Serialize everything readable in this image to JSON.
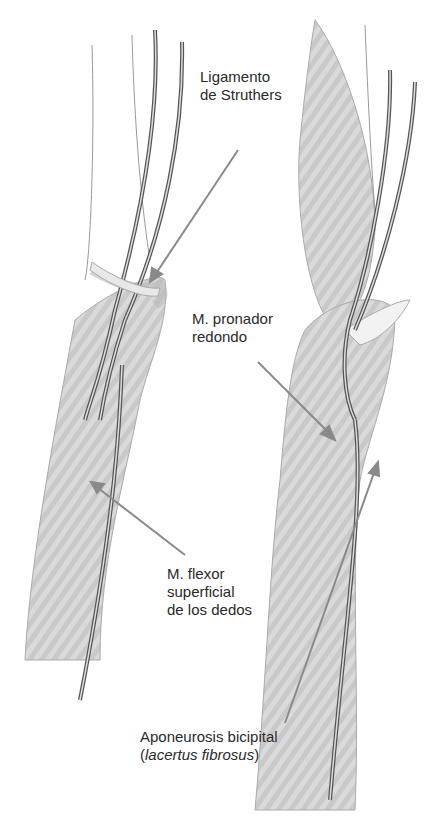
{
  "figure": {
    "panels": [
      "left-arm",
      "right-arm"
    ],
    "colors": {
      "muscle": "#d6d6d6",
      "vessel": "#555555",
      "arrow": "#8a8a8a",
      "text": "#2a2a2a"
    }
  },
  "labels": {
    "struthers": {
      "line1": "Ligamento",
      "line2": "de Struthers"
    },
    "pronador": {
      "line1": "M. pronador",
      "line2": "redondo"
    },
    "flexor": {
      "line1": "M. flexor",
      "line2": "superficial",
      "line3": "de los dedos"
    },
    "aponeurosis": {
      "line1": "Aponeurosis bicipital",
      "line2_open": "(",
      "line2_italic": "lacertus fibrosus",
      "line2_close": ")"
    }
  }
}
